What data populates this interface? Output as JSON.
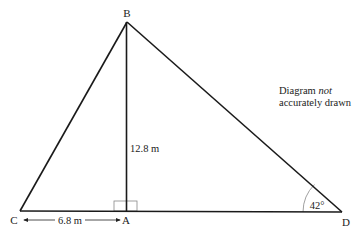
{
  "diagram": {
    "type": "triangle",
    "colors": {
      "line": "#1a1a1a",
      "text": "#222222",
      "box": "#888888",
      "arc": "#888888"
    },
    "vertices": {
      "B": {
        "label": "B"
      },
      "C": {
        "label": "C"
      },
      "A": {
        "label": "A"
      },
      "D": {
        "label": "D"
      }
    },
    "measurements": {
      "height_BA": "12.8 m",
      "base_CA": "6.8 m",
      "angle_D": "42°"
    },
    "right_angle_at": "A",
    "note": {
      "line1_prefix": "Diagram",
      "line1_emphasis": "not",
      "line2": "accurately drawn"
    }
  }
}
